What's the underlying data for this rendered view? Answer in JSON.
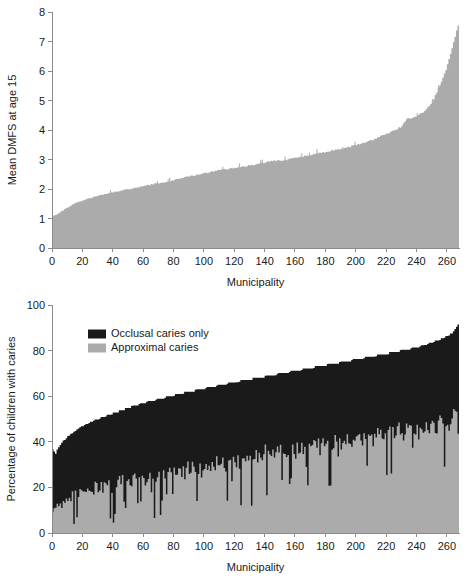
{
  "chart_data": [
    {
      "id": "dmfs-chart",
      "type": "area",
      "title": "",
      "xlabel": "Municipality",
      "ylabel": "Mean DMFS at age 15",
      "xlim": [
        0,
        268
      ],
      "ylim": [
        0,
        8
      ],
      "xticks": [
        0,
        20,
        40,
        60,
        80,
        100,
        120,
        140,
        160,
        180,
        200,
        220,
        240,
        260
      ],
      "yticks": [
        0,
        1,
        2,
        3,
        4,
        5,
        6,
        7,
        8
      ],
      "grid": false,
      "legend": null,
      "series": [
        {
          "name": "Mean DMFS at age 15",
          "color": "#ababab",
          "n": 268,
          "x": [
            1,
            3,
            5,
            7,
            9,
            11,
            13,
            15,
            17,
            19,
            21,
            23,
            25,
            27,
            29,
            31,
            33,
            35,
            37,
            39,
            41,
            43,
            45,
            47,
            49,
            51,
            53,
            55,
            57,
            59,
            61,
            63,
            65,
            67,
            69,
            71,
            73,
            75,
            77,
            79,
            81,
            83,
            85,
            87,
            89,
            91,
            93,
            95,
            97,
            99,
            101,
            103,
            105,
            107,
            109,
            111,
            113,
            115,
            117,
            119,
            121,
            123,
            125,
            127,
            129,
            131,
            133,
            135,
            137,
            139,
            141,
            143,
            145,
            147,
            149,
            151,
            153,
            155,
            157,
            159,
            161,
            163,
            165,
            167,
            169,
            171,
            173,
            175,
            177,
            179,
            181,
            183,
            185,
            187,
            189,
            191,
            193,
            195,
            197,
            199,
            201,
            203,
            205,
            207,
            209,
            211,
            213,
            215,
            217,
            219,
            221,
            223,
            225,
            227,
            229,
            231,
            233,
            235,
            237,
            239,
            241,
            243,
            245,
            247,
            249,
            251,
            253,
            255,
            257,
            259,
            261,
            263,
            265,
            267
          ],
          "values": [
            1.08,
            1.12,
            1.18,
            1.24,
            1.3,
            1.36,
            1.42,
            1.48,
            1.53,
            1.57,
            1.6,
            1.63,
            1.66,
            1.69,
            1.72,
            1.75,
            1.78,
            1.8,
            1.82,
            1.85,
            1.87,
            1.89,
            1.91,
            1.93,
            1.95,
            1.97,
            1.99,
            2.01,
            2.03,
            2.05,
            2.07,
            2.09,
            2.11,
            2.13,
            2.15,
            2.17,
            2.18,
            2.2,
            2.22,
            2.24,
            2.26,
            2.28,
            2.3,
            2.33,
            2.36,
            2.38,
            2.4,
            2.42,
            2.44,
            2.46,
            2.48,
            2.5,
            2.52,
            2.54,
            2.56,
            2.58,
            2.6,
            2.62,
            2.64,
            2.65,
            2.67,
            2.68,
            2.7,
            2.71,
            2.73,
            2.74,
            2.76,
            2.77,
            2.79,
            2.8,
            2.82,
            2.84,
            2.86,
            2.88,
            2.9,
            2.92,
            2.94,
            2.95,
            2.96,
            2.97,
            2.98,
            2.99,
            3.0,
            3.02,
            3.04,
            3.06,
            3.08,
            3.1,
            3.12,
            3.14,
            3.16,
            3.18,
            3.2,
            3.22,
            3.24,
            3.26,
            3.28,
            3.3,
            3.32,
            3.34,
            3.36,
            3.38,
            3.4,
            3.42,
            3.45,
            3.48,
            3.51,
            3.54,
            3.57,
            3.6,
            3.63,
            3.66,
            3.7,
            3.74,
            3.78,
            3.82,
            3.86,
            3.9,
            3.95,
            4.0,
            4.05,
            4.1,
            4.2,
            4.35,
            4.4,
            4.42,
            4.45,
            4.5,
            4.56,
            4.62,
            4.7,
            4.8,
            4.95,
            5.15
          ],
          "values_tail": [
            5.4,
            5.6,
            5.85,
            6.1,
            6.45,
            6.8,
            7.2,
            7.55
          ]
        }
      ]
    },
    {
      "id": "caries-chart",
      "type": "area",
      "stacked": true,
      "title": "",
      "xlabel": "Municipality",
      "ylabel": "Percentage of children with caries",
      "xlim": [
        0,
        268
      ],
      "ylim": [
        0,
        100
      ],
      "xticks": [
        0,
        20,
        40,
        60,
        80,
        100,
        120,
        140,
        160,
        180,
        200,
        220,
        240,
        260
      ],
      "yticks": [
        0,
        20,
        40,
        60,
        80,
        100
      ],
      "grid": false,
      "legend": {
        "position": "top-left",
        "entries": [
          {
            "label": "Occlusal caries only",
            "color": "#1a1a1a"
          },
          {
            "label": "Approximal caries",
            "color": "#ababab"
          }
        ]
      },
      "series": [
        {
          "name": "Approximal caries",
          "color": "#ababab",
          "note": "lower jagged band; percentage of children with approximal caries",
          "values": [
            9,
            11,
            8,
            13,
            10,
            15,
            12,
            17,
            14,
            19,
            16,
            21,
            18,
            22,
            19,
            23,
            20,
            24,
            21,
            25,
            16,
            26,
            22,
            27,
            19,
            28,
            23,
            29,
            20,
            30,
            24,
            18,
            25,
            31,
            22,
            26,
            32,
            23,
            27,
            33,
            16,
            28,
            34,
            24,
            29,
            35,
            25,
            30,
            21,
            31,
            26,
            32,
            27,
            22,
            28,
            33,
            24,
            29,
            34,
            25,
            30,
            35,
            19,
            31,
            26,
            32,
            27,
            33,
            28,
            34,
            24,
            29,
            35,
            30,
            36,
            26,
            31,
            37,
            27,
            32,
            38,
            28,
            33,
            24,
            34,
            29,
            35,
            30,
            36,
            25,
            31,
            37,
            26,
            32,
            38,
            28,
            33,
            39,
            29,
            34,
            20,
            35,
            30,
            36,
            31,
            37,
            27,
            33,
            38,
            29,
            34,
            40,
            30,
            35,
            41,
            31,
            36,
            26,
            32,
            37,
            43,
            33,
            38,
            28,
            34,
            39,
            30,
            35,
            41,
            31,
            36,
            42,
            32,
            37,
            28,
            33,
            38,
            44,
            34,
            39,
            30,
            35,
            40,
            46,
            36,
            41,
            31,
            37,
            42,
            33,
            38,
            43,
            34,
            39,
            45,
            35,
            40,
            30,
            36,
            41,
            47,
            37,
            42,
            32,
            38,
            43,
            34,
            39,
            44,
            36,
            41,
            46,
            37,
            42,
            33,
            38,
            43,
            48,
            39,
            44,
            35,
            40,
            45,
            36,
            41,
            46,
            38,
            43,
            33,
            39,
            44,
            50,
            40,
            45,
            36,
            41,
            46,
            37,
            42,
            47,
            39,
            44,
            34,
            40,
            45,
            51,
            41,
            46,
            37,
            42,
            47,
            38,
            43,
            48,
            40,
            45,
            35,
            41,
            46,
            52,
            42,
            47,
            38,
            43,
            48,
            39,
            44,
            49,
            41,
            46,
            36,
            42,
            47,
            53,
            43,
            48,
            39,
            44,
            49,
            40,
            45,
            50,
            42,
            47,
            37,
            43,
            48,
            54,
            44,
            49,
            40,
            45,
            50,
            41,
            46,
            51,
            43,
            48,
            38,
            44,
            49,
            55,
            45,
            50,
            42,
            47,
            52,
            57,
            48,
            53,
            61,
            54,
            60,
            49
          ]
        },
        {
          "name": "Occlusal caries only",
          "color": "#1a1a1a",
          "note": "upper band; total caries minus approximal",
          "total_values": [
            37,
            36,
            35,
            37,
            38,
            39,
            40,
            41,
            41,
            42,
            43,
            43,
            44,
            44,
            45,
            45,
            46,
            46,
            47,
            47,
            47,
            48,
            48,
            48,
            49,
            49,
            49,
            50,
            50,
            50,
            50,
            51,
            51,
            51,
            51,
            52,
            52,
            52,
            52,
            53,
            53,
            53,
            53,
            54,
            54,
            54,
            54,
            55,
            55,
            55,
            55,
            56,
            56,
            56,
            56,
            56,
            57,
            57,
            57,
            57,
            57,
            58,
            58,
            58,
            58,
            58,
            58,
            59,
            59,
            59,
            59,
            59,
            59,
            60,
            60,
            60,
            60,
            60,
            60,
            61,
            61,
            61,
            61,
            61,
            61,
            62,
            62,
            62,
            62,
            62,
            62,
            62,
            63,
            63,
            63,
            63,
            63,
            63,
            63,
            64,
            64,
            64,
            64,
            64,
            64,
            64,
            65,
            65,
            65,
            65,
            65,
            65,
            65,
            66,
            66,
            66,
            66,
            66,
            66,
            66,
            66,
            67,
            67,
            67,
            67,
            67,
            67,
            67,
            67,
            68,
            68,
            68,
            68,
            68,
            68,
            68,
            68,
            69,
            69,
            69,
            69,
            69,
            69,
            69,
            69,
            70,
            70,
            70,
            70,
            70,
            70,
            70,
            70,
            71,
            71,
            71,
            71,
            71,
            71,
            71,
            71,
            72,
            72,
            72,
            72,
            72,
            72,
            72,
            72,
            73,
            73,
            73,
            73,
            73,
            73,
            73,
            73,
            74,
            74,
            74,
            74,
            74,
            74,
            74,
            74,
            75,
            75,
            75,
            75,
            75,
            75,
            75,
            75,
            76,
            76,
            76,
            76,
            76,
            76,
            76,
            76,
            77,
            77,
            77,
            77,
            77,
            77,
            77,
            77,
            78,
            78,
            78,
            78,
            78,
            78,
            78,
            78,
            79,
            79,
            79,
            79,
            79,
            79,
            79,
            80,
            80,
            80,
            80,
            80,
            80,
            80,
            81,
            81,
            81,
            81,
            81,
            81,
            82,
            82,
            82,
            82,
            82,
            83,
            83,
            83,
            83,
            84,
            84,
            84,
            84,
            85,
            85,
            85,
            86,
            86,
            86,
            87,
            87,
            88,
            89,
            90,
            91
          ]
        }
      ]
    }
  ]
}
